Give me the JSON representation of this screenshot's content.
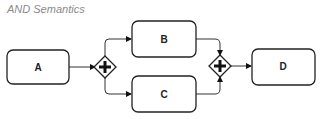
{
  "title": "AND Semantics",
  "nodes": {
    "a": {
      "label": "A",
      "type": "task"
    },
    "b": {
      "label": "B",
      "type": "task"
    },
    "c": {
      "label": "C",
      "type": "task"
    },
    "d": {
      "label": "D",
      "type": "task"
    },
    "split": {
      "label": "",
      "type": "parallel-gateway"
    },
    "join": {
      "label": "",
      "type": "parallel-gateway"
    }
  },
  "edges": [
    {
      "from": "A",
      "to": "split"
    },
    {
      "from": "split",
      "to": "B"
    },
    {
      "from": "split",
      "to": "C"
    },
    {
      "from": "B",
      "to": "join"
    },
    {
      "from": "C",
      "to": "join"
    },
    {
      "from": "join",
      "to": "D"
    }
  ]
}
